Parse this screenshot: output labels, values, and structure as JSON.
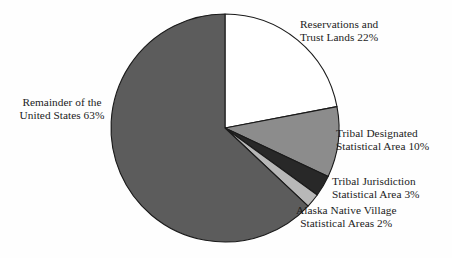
{
  "figure": {
    "background_color": "#fefefe",
    "text_color": "#1c1c1c",
    "outline_color": "#1a1a1a",
    "width": 452,
    "height": 258
  },
  "chart_data": {
    "type": "pie",
    "title": "",
    "subtitle": "",
    "xlabel": "",
    "ylabel": "",
    "grid": false,
    "legend_position": "callout-labels",
    "start_angle_deg": 0,
    "direction": "clockwise",
    "center": {
      "x": 225,
      "y": 128
    },
    "radius": 114,
    "units": "percent",
    "total": 100,
    "categories": [
      "Reservations and Trust Lands",
      "Tribal Designated Statistical Area",
      "Tribal Jurisdiction Statistical Area",
      "Alaska Native Village Statistical Areas",
      "Remainder of the United States"
    ],
    "values": [
      22,
      10,
      3,
      2,
      63
    ],
    "slices": [
      {
        "key": "reservations",
        "name": "Reservations and Trust Lands",
        "value": 22,
        "value_label": "22%",
        "color": "#ffffff",
        "label_lines": [
          "Reservations and",
          "Trust Lands 22%"
        ]
      },
      {
        "key": "tribal-designated",
        "name": "Tribal Designated Statistical Area",
        "value": 10,
        "value_label": "10%",
        "color": "#8c8c8c",
        "label_lines": [
          "Tribal Designated",
          "Statistical Area 10%"
        ]
      },
      {
        "key": "tribal-jurisdiction",
        "name": "Tribal Jurisdiction Statistical Area",
        "value": 3,
        "value_label": "3%",
        "color": "#282828",
        "label_lines": [
          "Tribal Jurisdiction",
          "Statistical Area 3%"
        ]
      },
      {
        "key": "alaska-native-village",
        "name": "Alaska Native Village Statistical Areas",
        "value": 2,
        "value_label": "2%",
        "color": "#b8b8b8",
        "label_lines": [
          "Alaska Native Village",
          "Statistical Areas 2%"
        ]
      },
      {
        "key": "remainder",
        "name": "Remainder of the United States",
        "value": 63,
        "value_label": "63%",
        "color": "#5c5c5c",
        "label_lines": [
          "Remainder of the",
          "United States 63%"
        ]
      }
    ]
  },
  "labels": {
    "reservations": {
      "line1": "Reservations and",
      "line2": "Trust Lands 22%"
    },
    "remainder": {
      "line1": "Remainder of the",
      "line2": "United States 63%"
    },
    "tribal_designated": {
      "line1": "Tribal Designated",
      "line2": "Statistical Area 10%"
    },
    "tribal_jurisdiction": {
      "line1": "Tribal Jurisdiction",
      "line2": "Statistical Area 3%"
    },
    "alaska": {
      "line1": "Alaska Native Village",
      "line2": "Statistical Areas 2%"
    }
  }
}
